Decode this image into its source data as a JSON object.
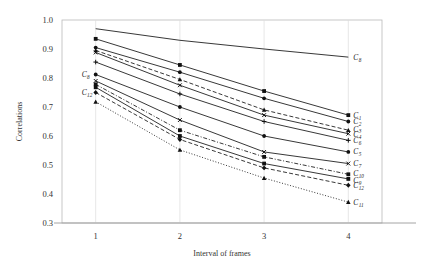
{
  "chart_data": {
    "type": "line",
    "title": "",
    "xlabel": "Interval of frames",
    "ylabel": "Correlations",
    "x": [
      1,
      2,
      3,
      4
    ],
    "xtick_labels": [
      "1",
      "2",
      "3",
      "4"
    ],
    "ytick_labels": [
      "0.3",
      "0.4",
      "0.5",
      "0.6",
      "0.7",
      "0.8",
      "0.9",
      "1.0"
    ],
    "ytick_values": [
      0.3,
      0.4,
      0.5,
      0.6,
      0.7,
      0.8,
      0.9,
      1.0
    ],
    "xlim": [
      0.6,
      4.4
    ],
    "ylim": [
      0.3,
      1.0
    ],
    "grid": "vertical-only",
    "legend_position": "inline-right-end-of-line",
    "series": [
      {
        "name": "C8",
        "label": "C",
        "sub": "8",
        "values": [
          0.97,
          0.93,
          0.9,
          0.872
        ],
        "style": "solid",
        "marker": "none",
        "end_label_y": 0.872
      },
      {
        "name": "C1",
        "label": "C",
        "sub": "1",
        "values": [
          0.935,
          0.845,
          0.755,
          0.672
        ],
        "style": "solid",
        "marker": "square",
        "end_label_y": 0.672
      },
      {
        "name": "C2",
        "label": "C",
        "sub": "2",
        "values": [
          0.905,
          0.82,
          0.73,
          0.65
        ],
        "style": "solid",
        "marker": "circle",
        "end_label_y": 0.65
      },
      {
        "name": "C3",
        "label": "C",
        "sub": "3",
        "values": [
          0.895,
          0.795,
          0.69,
          0.62
        ],
        "style": "dashed",
        "marker": "triangle",
        "end_label_y": 0.624
      },
      {
        "name": "C4",
        "label": "C",
        "sub": "4",
        "values": [
          0.888,
          0.775,
          0.672,
          0.608
        ],
        "style": "solid",
        "marker": "cross",
        "end_label_y": 0.606
      },
      {
        "name": "C6",
        "label": "C",
        "sub": "6",
        "values": [
          0.855,
          0.745,
          0.65,
          0.585
        ],
        "style": "solid",
        "marker": "plus",
        "end_label_y": 0.585
      },
      {
        "name": "C5",
        "label": "C",
        "sub": "5",
        "values": [
          0.812,
          0.7,
          0.6,
          0.545
        ],
        "style": "solid",
        "marker": "circle",
        "end_label_y": 0.545
      },
      {
        "name": "C7",
        "label": "C",
        "sub": "7",
        "values": [
          0.79,
          0.655,
          0.545,
          0.505
        ],
        "style": "solid",
        "marker": "cross",
        "end_label_y": 0.505
      },
      {
        "name": "C10",
        "label": "C",
        "sub": "10",
        "values": [
          0.778,
          0.62,
          0.528,
          0.468
        ],
        "style": "dashdot",
        "marker": "square",
        "end_label_y": 0.47
      },
      {
        "name": "C9",
        "label": "C",
        "sub": "9",
        "values": [
          0.768,
          0.6,
          0.505,
          0.452
        ],
        "style": "solid",
        "marker": "square",
        "end_label_y": 0.446
      },
      {
        "name": "C12",
        "label": "C",
        "sub": "12",
        "values": [
          0.75,
          0.588,
          0.49,
          0.43
        ],
        "style": "dashed",
        "marker": "diamond",
        "end_label_y": 0.43
      },
      {
        "name": "C11",
        "label": "C",
        "sub": "11",
        "values": [
          0.718,
          0.552,
          0.455,
          0.372
        ],
        "style": "dotted",
        "marker": "triangle",
        "end_label_y": 0.372
      }
    ],
    "start_labels": [
      {
        "name": "C8-start",
        "label": "C",
        "sub": "8",
        "value": 0.812
      },
      {
        "name": "C12-start",
        "label": "C",
        "sub": "12",
        "value": 0.75
      }
    ]
  }
}
